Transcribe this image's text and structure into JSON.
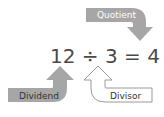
{
  "equation": {
    "text": "12 ÷ 3 = 4",
    "dividend": "12",
    "operator": "÷",
    "divisor": "3",
    "equals": "=",
    "quotient": "4"
  },
  "labels": {
    "quotient": "Quotient",
    "dividend": "Dividend",
    "divisor": "Divisor"
  },
  "colors": {
    "filled_arrow": "#a6a6a6",
    "outline_arrow_stroke": "#9a9a9a",
    "outline_arrow_fill": "#ffffff",
    "equation_text": "#4a4a4a"
  }
}
